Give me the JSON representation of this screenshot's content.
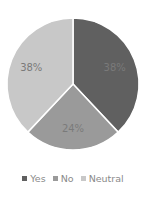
{
  "chart_data": {
    "type": "pie",
    "title": "",
    "categories": [
      "Yes",
      "No",
      "Neutral"
    ],
    "values": [
      38,
      24,
      38
    ],
    "labels": [
      "38%",
      "24%",
      "38%"
    ],
    "colors": [
      "#606060",
      "#9a9a9a",
      "#c8c8c8"
    ],
    "start_angle_deg": 0,
    "direction": "clockwise",
    "legend_position": "bottom"
  },
  "legend": {
    "items": [
      {
        "label": "Yes",
        "color": "#606060"
      },
      {
        "label": "No",
        "color": "#9a9a9a"
      },
      {
        "label": "Neutral",
        "color": "#c8c8c8"
      }
    ]
  }
}
